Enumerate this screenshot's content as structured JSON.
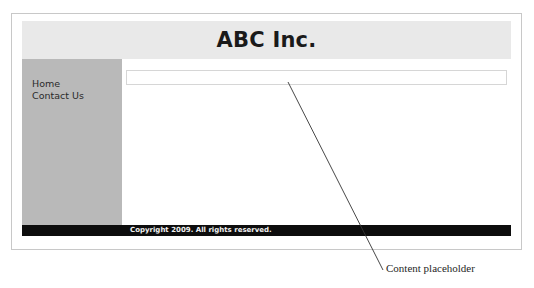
{
  "figure": {
    "annotation": {
      "caption": "Content placeholder",
      "leader_line": {
        "from_x": 288,
        "from_y": 82,
        "to_x": 383,
        "to_y": 270
      }
    },
    "colors": {
      "frame_border": "#c8c8c8",
      "header_background": "#e9e9e9",
      "sidebar_background": "#b9b9b9",
      "content_background": "#ffffff",
      "footer_background": "#0d0d0d",
      "footer_text": "#f2f2f2",
      "title_text": "#1a1a1a",
      "placeholder_border": "#d6d6d6"
    }
  },
  "webpage": {
    "header": {
      "title": "ABC Inc."
    },
    "sidebar": {
      "items": [
        {
          "label": "Home"
        },
        {
          "label": "Contact Us"
        }
      ]
    },
    "content": {
      "placeholder": {
        "value": "",
        "placeholder": ""
      }
    },
    "footer": {
      "copyright": "Copyright 2009. All rights reserved."
    }
  }
}
